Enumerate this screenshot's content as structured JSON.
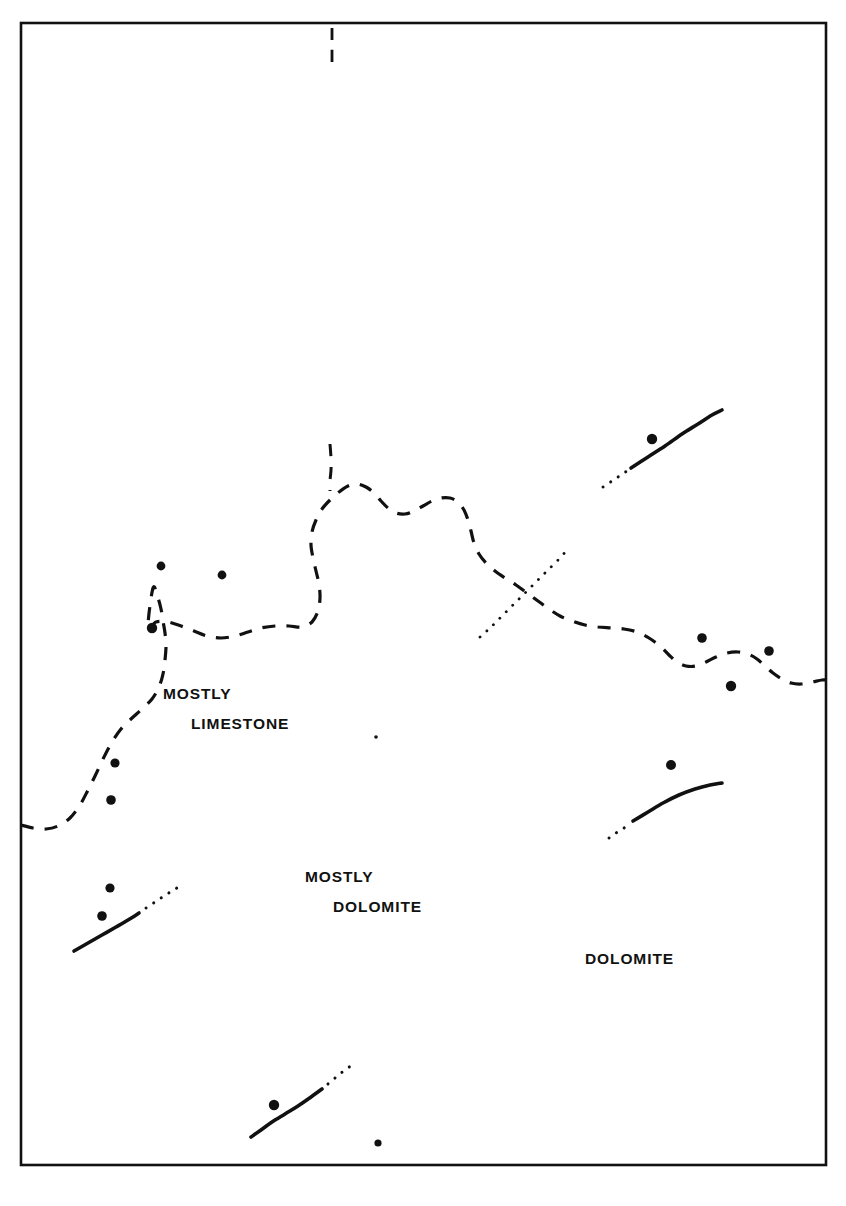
{
  "figure": {
    "kind": "geologic-sketch-map",
    "background_color": "#ffffff",
    "ink_color": "#111111",
    "frame": {
      "x": 21,
      "y": 23,
      "width": 805,
      "height": 1142,
      "stroke_width": 2.6
    }
  },
  "labels": {
    "mostly_limestone": {
      "line1": "MOSTLY",
      "line2": "LIMESTONE"
    },
    "mostly_dolomite": {
      "line1": "MOSTLY",
      "line2": "DOLOMITE"
    },
    "dolomite": {
      "line1": "DOLOMITE",
      "line2": ""
    }
  },
  "legend_semantics": {
    "dashed_line": "approximate facies contact",
    "solid_line": "fault, located",
    "dotted_line": "fault, concealed or inferred",
    "filled_dot": "well / sample control point"
  },
  "map_data": {
    "contacts": [
      {
        "name": "limestone-dolomite-contact",
        "style": "dashed",
        "stroke_width": 3.2,
        "dash": "13 11",
        "points": [
          [
            21,
            825
          ],
          [
            33,
            828
          ],
          [
            46,
            829
          ],
          [
            58,
            826
          ],
          [
            70,
            818
          ],
          [
            80,
            805
          ],
          [
            88,
            790
          ],
          [
            96,
            774
          ],
          [
            104,
            757
          ],
          [
            112,
            742
          ],
          [
            121,
            729
          ],
          [
            131,
            719
          ],
          [
            142,
            709
          ],
          [
            152,
            699
          ],
          [
            159,
            687
          ],
          [
            163,
            674
          ],
          [
            165,
            660
          ],
          [
            166,
            646
          ],
          [
            165,
            633
          ],
          [
            163,
            621
          ],
          [
            161,
            609
          ],
          [
            158,
            598
          ],
          [
            153,
            588
          ],
          [
            148,
            628
          ],
          [
            156,
            622
          ],
          [
            168,
            622
          ],
          [
            181,
            626
          ],
          [
            194,
            631
          ],
          [
            207,
            636
          ],
          [
            221,
            638
          ],
          [
            235,
            636
          ],
          [
            248,
            632
          ],
          [
            261,
            628
          ],
          [
            275,
            626
          ],
          [
            289,
            626
          ],
          [
            302,
            627
          ],
          [
            312,
            622
          ],
          [
            318,
            611
          ],
          [
            320,
            598
          ],
          [
            319,
            584
          ],
          [
            316,
            571
          ],
          [
            313,
            558
          ],
          [
            311,
            545
          ],
          [
            312,
            532
          ],
          [
            316,
            520
          ],
          [
            322,
            509
          ],
          [
            330,
            500
          ],
          [
            339,
            492
          ],
          [
            348,
            486
          ],
          [
            357,
            484
          ],
          [
            366,
            487
          ],
          [
            374,
            493
          ],
          [
            381,
            501
          ],
          [
            388,
            508
          ],
          [
            396,
            513
          ],
          [
            405,
            514
          ],
          [
            414,
            511
          ],
          [
            423,
            506
          ],
          [
            432,
            501
          ],
          [
            441,
            498
          ],
          [
            450,
            498
          ],
          [
            458,
            502
          ],
          [
            464,
            510
          ],
          [
            468,
            520
          ],
          [
            471,
            531
          ],
          [
            474,
            543
          ],
          [
            479,
            554
          ],
          [
            486,
            563
          ],
          [
            495,
            571
          ],
          [
            505,
            578
          ],
          [
            516,
            585
          ],
          [
            527,
            593
          ],
          [
            538,
            601
          ],
          [
            549,
            609
          ],
          [
            560,
            616
          ],
          [
            572,
            621
          ],
          [
            585,
            625
          ],
          [
            598,
            627
          ],
          [
            611,
            628
          ],
          [
            624,
            629
          ],
          [
            637,
            632
          ],
          [
            649,
            638
          ],
          [
            660,
            646
          ],
          [
            669,
            655
          ],
          [
            677,
            662
          ],
          [
            686,
            666
          ],
          [
            696,
            666
          ],
          [
            706,
            662
          ],
          [
            716,
            657
          ],
          [
            727,
            653
          ],
          [
            738,
            652
          ],
          [
            748,
            654
          ],
          [
            757,
            659
          ],
          [
            765,
            666
          ],
          [
            773,
            673
          ],
          [
            782,
            679
          ],
          [
            791,
            683
          ],
          [
            801,
            684
          ],
          [
            812,
            682
          ],
          [
            822,
            680
          ],
          [
            826,
            680
          ]
        ]
      },
      {
        "name": "upper-contact-spur",
        "style": "dashed",
        "stroke_width": 3.0,
        "dash": "12 11",
        "points": [
          [
            330,
            444
          ],
          [
            331,
            458
          ],
          [
            331,
            470
          ],
          [
            330,
            481
          ],
          [
            330,
            491
          ]
        ]
      },
      {
        "name": "top-border-tick",
        "style": "dashed",
        "stroke_width": 2.8,
        "dash": "12 10",
        "points": [
          [
            332,
            28
          ],
          [
            332,
            44
          ],
          [
            332,
            62
          ]
        ]
      }
    ],
    "faults": [
      {
        "name": "fault-northeast",
        "solid": [
          [
            631,
            468
          ],
          [
            648,
            457
          ],
          [
            665,
            446
          ],
          [
            682,
            434
          ],
          [
            698,
            424
          ],
          [
            712,
            415
          ],
          [
            722,
            410
          ]
        ],
        "dotted": [
          [
            603,
            487
          ],
          [
            612,
            481
          ],
          [
            621,
            475
          ],
          [
            630,
            469
          ]
        ],
        "stroke_width": 3.6
      },
      {
        "name": "fault-east",
        "solid": [
          [
            633,
            821
          ],
          [
            648,
            812
          ],
          [
            663,
            803
          ],
          [
            679,
            795
          ],
          [
            695,
            789
          ],
          [
            710,
            785
          ],
          [
            722,
            783
          ]
        ],
        "dotted": [
          [
            609,
            838
          ],
          [
            616,
            833
          ],
          [
            624,
            828
          ],
          [
            631,
            823
          ]
        ],
        "stroke_width": 3.6
      },
      {
        "name": "fault-southwest",
        "solid": [
          [
            74,
            951
          ],
          [
            88,
            943
          ],
          [
            102,
            935
          ],
          [
            116,
            927
          ],
          [
            128,
            920
          ],
          [
            139,
            913
          ]
        ],
        "dotted": [
          [
            146,
            908
          ],
          [
            155,
            902
          ],
          [
            164,
            896
          ],
          [
            172,
            891
          ],
          [
            180,
            886
          ]
        ],
        "stroke_width": 3.6
      },
      {
        "name": "fault-south",
        "solid": [
          [
            251,
            1137
          ],
          [
            261,
            1130
          ],
          [
            272,
            1122
          ],
          [
            285,
            1114
          ],
          [
            298,
            1106
          ],
          [
            311,
            1097
          ],
          [
            322,
            1089
          ]
        ],
        "dotted": [
          [
            328,
            1084
          ],
          [
            335,
            1078
          ],
          [
            341,
            1073
          ],
          [
            348,
            1068
          ],
          [
            354,
            1063
          ]
        ],
        "stroke_width": 3.6
      },
      {
        "name": "fault-central-concealed",
        "solid": [],
        "dotted": [
          [
            480,
            637
          ],
          [
            490,
            628
          ],
          [
            500,
            618
          ],
          [
            510,
            608
          ],
          [
            520,
            598
          ],
          [
            530,
            588
          ],
          [
            540,
            578
          ],
          [
            550,
            568
          ],
          [
            560,
            558
          ],
          [
            566,
            551
          ]
        ],
        "stroke_width": 3.4
      }
    ],
    "control_points": [
      {
        "id": "cp-01",
        "x": 161,
        "y": 566,
        "r": 4.4
      },
      {
        "id": "cp-02",
        "x": 222,
        "y": 575,
        "r": 4.4
      },
      {
        "id": "cp-03",
        "x": 152,
        "y": 628,
        "r": 5.2
      },
      {
        "id": "cp-04",
        "x": 115,
        "y": 763,
        "r": 4.6
      },
      {
        "id": "cp-05",
        "x": 111,
        "y": 800,
        "r": 4.8
      },
      {
        "id": "cp-06",
        "x": 110,
        "y": 888,
        "r": 4.6
      },
      {
        "id": "cp-07",
        "x": 102,
        "y": 916,
        "r": 4.8
      },
      {
        "id": "cp-08",
        "x": 652,
        "y": 439,
        "r": 5.2
      },
      {
        "id": "cp-09",
        "x": 702,
        "y": 638,
        "r": 4.8
      },
      {
        "id": "cp-10",
        "x": 769,
        "y": 651,
        "r": 4.8
      },
      {
        "id": "cp-11",
        "x": 731,
        "y": 686,
        "r": 5.2
      },
      {
        "id": "cp-12",
        "x": 671,
        "y": 765,
        "r": 5.0
      },
      {
        "id": "cp-13",
        "x": 274,
        "y": 1105,
        "r": 5.2
      },
      {
        "id": "cp-14",
        "x": 378,
        "y": 1143,
        "r": 3.6
      },
      {
        "id": "cp-15",
        "x": 376,
        "y": 737,
        "r": 1.8
      }
    ]
  }
}
